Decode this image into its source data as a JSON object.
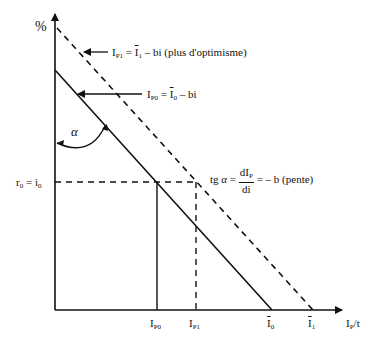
{
  "diagram": {
    "y_axis_label": "%",
    "x_axis_label": {
      "main": "I",
      "sub": "P",
      "rest": "/t"
    },
    "alpha_symbol": "α",
    "rate_label": {
      "left": "r",
      "left_sub": "0",
      "eq": " = ",
      "right": "i",
      "right_sub": "0"
    },
    "line_optimism": {
      "lhs": "I",
      "lhs_sub": "P1",
      "eq": " = ",
      "rhs": "I",
      "rhs_sub": "1",
      "tail": " – bi (plus d'optimisme)"
    },
    "line_base": {
      "lhs": "I",
      "lhs_sub": "P0",
      "eq": " = ",
      "rhs": "I",
      "rhs_sub": "0",
      "tail": " – bi"
    },
    "slope": {
      "prefix": "tg ",
      "alpha": "α",
      "eq": " = ",
      "num": "dI",
      "num_sub": "P",
      "den": "di",
      "tail": " = – b (pente)"
    },
    "x_ticks": [
      {
        "main": "I",
        "sub": "P0",
        "overline": false
      },
      {
        "main": "I",
        "sub": "P1",
        "overline": false
      },
      {
        "main": "I",
        "sub": "0",
        "overline": true
      },
      {
        "main": "I",
        "sub": "1",
        "overline": true
      }
    ]
  }
}
